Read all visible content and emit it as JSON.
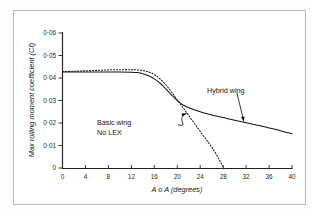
{
  "figure": {
    "background_color": "#fdfdfc",
    "ink_color": "#141414",
    "frame_color": "#b9b9b4"
  },
  "axes": {
    "x_title": "A o A (degrees)",
    "y_title": "Max rolling moment coefficient (Cℓ)",
    "x_ticks": [
      "0",
      "4",
      "8",
      "12",
      "16",
      "20",
      "24",
      "28",
      "32",
      "36",
      "40"
    ],
    "y_ticks": [
      "0·06",
      "0·05",
      "0·04",
      "0·03",
      "0·02",
      "0·01",
      "0"
    ]
  },
  "annotations": {
    "hybrid_label": "Hybrid wing",
    "basic_label_line1": "Basic wing",
    "basic_label_line2": "No LEX"
  },
  "chart_data": {
    "type": "line",
    "title": "",
    "subtitle": "",
    "xlabel": "A o A (degrees)",
    "ylabel": "Max rolling moment coefficient (Cl)",
    "xlim": [
      0,
      40
    ],
    "ylim": [
      0,
      0.06
    ],
    "xticks": [
      0,
      4,
      8,
      12,
      16,
      20,
      24,
      28,
      32,
      36,
      40
    ],
    "yticks": [
      0,
      0.01,
      0.02,
      0.03,
      0.04,
      0.05,
      0.06
    ],
    "grid": false,
    "legend": "inline-annotations",
    "series": [
      {
        "name": "Hybrid wing",
        "style": "solid",
        "x": [
          0,
          2,
          4,
          6,
          8,
          10,
          12,
          13,
          14,
          15,
          16,
          17,
          18,
          19,
          20,
          21,
          22,
          24,
          26,
          28,
          30,
          32,
          34,
          36,
          38,
          40
        ],
        "values": [
          0.0427,
          0.0427,
          0.0427,
          0.0427,
          0.0427,
          0.0427,
          0.0426,
          0.0424,
          0.0419,
          0.041,
          0.0396,
          0.0377,
          0.0352,
          0.0325,
          0.0299,
          0.028,
          0.0268,
          0.025,
          0.0236,
          0.0224,
          0.0212,
          0.0201,
          0.019,
          0.0178,
          0.0166,
          0.0152
        ]
      },
      {
        "name": "Basic wing No LEX",
        "style": "dotted",
        "x": [
          0,
          2,
          4,
          6,
          8,
          10,
          12,
          13,
          14,
          15,
          16,
          17,
          18,
          19,
          20,
          21,
          22,
          23,
          24,
          25,
          26,
          27,
          28
        ],
        "values": [
          0.0429,
          0.043,
          0.0432,
          0.0434,
          0.0436,
          0.0437,
          0.0437,
          0.0436,
          0.0433,
          0.0427,
          0.0415,
          0.0396,
          0.037,
          0.0338,
          0.0303,
          0.0268,
          0.0233,
          0.0198,
          0.0163,
          0.0128,
          0.0093,
          0.0052,
          0.0005
        ]
      }
    ],
    "annotations": [
      {
        "text": "Hybrid wing",
        "x": 30.5,
        "y": 0.0358,
        "points_to_x": 31.6,
        "points_to_y": 0.0208
      },
      {
        "text": "Basic wing\nNo LEX",
        "x": 12.5,
        "y": 0.0212,
        "points_to_x": 21.6,
        "points_to_y": 0.0242
      }
    ]
  }
}
